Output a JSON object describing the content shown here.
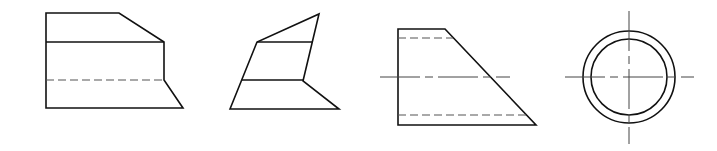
{
  "figures": [
    {
      "id": "view-1",
      "description": "Front view of truncated block with chamfer and hidden edge"
    },
    {
      "id": "view-2",
      "description": "Oblique sheared block view"
    },
    {
      "id": "view-3",
      "description": "Trapezoidal side view with hidden lines and centerline"
    },
    {
      "id": "view-4",
      "description": "Concentric circles end view with centerlines"
    }
  ],
  "line_styles": {
    "solid": "visible edge",
    "dashed": "hidden edge",
    "dash-dot": "centerline"
  },
  "colors": {
    "background": "#ffffff",
    "stroke": "#111111"
  }
}
